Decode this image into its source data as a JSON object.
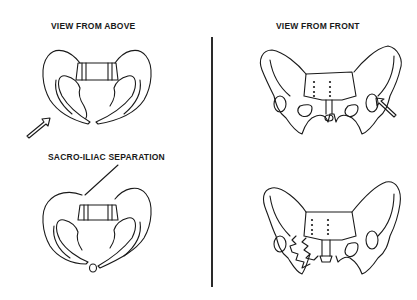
{
  "diagram": {
    "title_left": "VIEW FROM ABOVE",
    "title_right": "VIEW FROM FRONT",
    "annotation": "SACRO-ILIAC  SEPARATION",
    "panels": [
      {
        "id": "above-normal",
        "view": "above",
        "state": "intact",
        "arrow": "force arrow pointing up-right toward pelvis"
      },
      {
        "id": "front-normal",
        "view": "front",
        "state": "intact",
        "arrow": "force arrow pointing up-left toward pelvis"
      },
      {
        "id": "above-separated",
        "view": "above",
        "state": "sacro-iliac separation with pubic fragment"
      },
      {
        "id": "front-fractured",
        "view": "front",
        "state": "fractured left pubic/iliac region"
      }
    ],
    "colors": {
      "line": "#1a1a1a",
      "background": "#ffffff"
    }
  }
}
